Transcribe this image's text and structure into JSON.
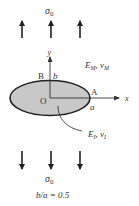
{
  "diagram": {
    "type": "elliptical-inclusion-under-uniaxial-tension",
    "top_stress_label": "σ0",
    "bottom_stress_label": "σ0",
    "matrix_label": {
      "E": "E",
      "E_sub": "M",
      "nu": "ν",
      "nu_sub": "M",
      "sep": ", "
    },
    "inclusion_label": {
      "E": "E",
      "E_sub": "I",
      "nu": "ν",
      "nu_sub": "I",
      "sep": ", "
    },
    "points": {
      "origin": "O",
      "A": "A",
      "B": "B"
    },
    "semi_axes": {
      "a": "a",
      "b": "b"
    },
    "axes": {
      "x": "x",
      "y": "y"
    },
    "aspect_ratio_label": "b/a = 0.5",
    "aspect_ratio": 0.5,
    "arrow_count_top": 3,
    "arrow_count_bottom": 3,
    "colors": {
      "inclusion_fill": "#c8c8c8",
      "stroke": "#222222",
      "text": "#333333"
    }
  }
}
